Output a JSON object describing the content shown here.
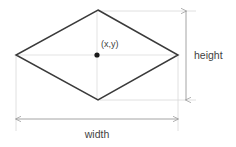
{
  "diagram": {
    "type": "rhombus-dimension-diagram",
    "shape_name": "rhombus",
    "center_label": "(x,y)",
    "height_label": "height",
    "width_label": "width",
    "colors": {
      "shape_stroke": "#3a3a3a",
      "dimension_line": "#9a9a9a",
      "extension_line": "#d0d0d0",
      "center_dot": "#1a1a1a",
      "text": "#3f3f3f",
      "background": "#ffffff"
    },
    "geometry": {
      "top_vertex": [
        98,
        10
      ],
      "right_vertex": [
        178,
        55
      ],
      "bottom_vertex": [
        98,
        100
      ],
      "left_vertex": [
        16,
        55
      ],
      "center_point": [
        97,
        55
      ],
      "width_dimension_y": 119,
      "height_dimension_x": 186
    }
  }
}
